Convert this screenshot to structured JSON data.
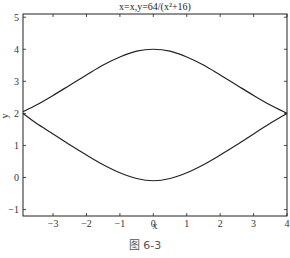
{
  "chart_data": {
    "type": "line",
    "title": "x=x,y=64/(x²+16)",
    "xlabel": "x",
    "ylabel": "y",
    "xlim": [
      -3.9,
      4
    ],
    "ylim": [
      -1.2,
      5.1
    ],
    "xticks": [
      -3,
      -2,
      -1,
      0,
      1,
      2,
      3,
      4
    ],
    "yticks": [
      -1,
      0,
      1,
      2,
      3,
      4,
      5
    ],
    "xtick_labels": [
      "−3",
      "−2",
      "−1",
      "0",
      "1",
      "2",
      "3",
      "4"
    ],
    "ytick_labels": [
      "−1",
      "0",
      "1",
      "2",
      "3",
      "4",
      "5"
    ],
    "grid": false,
    "legend": null,
    "series": [
      {
        "name": "upper",
        "x": [
          -3.9,
          -3.5,
          -3,
          -2.5,
          -2,
          -1.5,
          -1,
          -0.5,
          0,
          0.5,
          1,
          1.5,
          2,
          2.5,
          3,
          3.5,
          4
        ],
        "y": [
          2.05,
          2.26,
          2.56,
          2.88,
          3.2,
          3.51,
          3.76,
          3.94,
          4.0,
          3.94,
          3.76,
          3.51,
          3.2,
          2.88,
          2.56,
          2.26,
          2.0
        ]
      },
      {
        "name": "lower",
        "x": [
          -3.9,
          -3.5,
          -3,
          -2.5,
          -2,
          -1.5,
          -1,
          -0.5,
          0,
          0.5,
          1,
          1.5,
          2,
          2.5,
          3,
          3.5,
          4
        ],
        "y": [
          2.0,
          1.69,
          1.36,
          1.02,
          0.7,
          0.4,
          0.15,
          -0.03,
          -0.1,
          -0.03,
          0.15,
          0.4,
          0.7,
          1.02,
          1.36,
          1.69,
          2.0
        ]
      }
    ],
    "caption": "图 6-3"
  }
}
